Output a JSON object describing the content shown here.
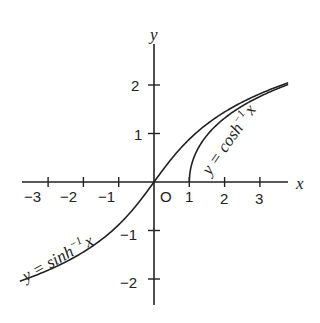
{
  "chart_data": {
    "type": "line",
    "title": "",
    "xlabel": "x",
    "ylabel": "y",
    "xlim": [
      -3.8,
      3.8
    ],
    "ylim": [
      -2.3,
      2.8
    ],
    "grid": false,
    "x_ticks": [
      "-3",
      "-2",
      "-1",
      "0",
      "1",
      "2",
      "3"
    ],
    "y_ticks": [
      "-2",
      "-1",
      "1",
      "2"
    ],
    "origin_label": "O",
    "series": [
      {
        "name": "y = sinh^-1 x",
        "label": "y = sinh⁻¹x",
        "function": "asinh",
        "x_range": [
          -3.8,
          3.8
        ]
      },
      {
        "name": "y = cosh^-1 x",
        "label": "y = cosh⁻¹x",
        "function": "acosh",
        "x_range": [
          1,
          3.8
        ]
      }
    ]
  },
  "labels": {
    "x_axis": "x",
    "y_axis": "y",
    "origin": "O",
    "sinh_text": "y = sinh",
    "sinh_exp": "−1",
    "sinh_var": "x",
    "cosh_text": "y = cosh",
    "cosh_exp": "−1",
    "cosh_var": "x",
    "xt_m3": "−3",
    "xt_m2": "−2",
    "xt_m1": "−1",
    "xt_1": "1",
    "xt_2": "2",
    "xt_3": "3",
    "yt_2": "2",
    "yt_1": "1",
    "yt_m1": "−1",
    "yt_m2": "−2"
  }
}
